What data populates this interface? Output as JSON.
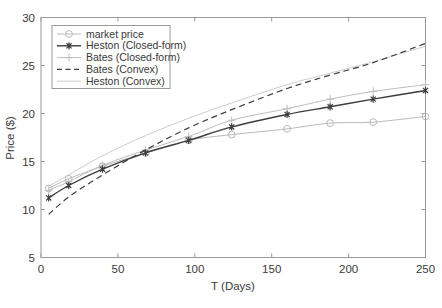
{
  "chart_data": {
    "type": "line",
    "title": "",
    "xlabel": "T (Days)",
    "ylabel": "Price ($)",
    "xlim": [
      0,
      250
    ],
    "ylim": [
      5,
      30
    ],
    "xticks": [
      0,
      50,
      100,
      150,
      200,
      250
    ],
    "yticks": [
      5,
      10,
      15,
      20,
      25,
      30
    ],
    "grid": false,
    "legend_position": "top-left",
    "x": [
      5,
      18,
      40,
      68,
      96,
      124,
      160,
      188,
      216,
      250
    ],
    "series": [
      {
        "name": "market price",
        "marker": "circle",
        "linestyle": "solid",
        "color": "#b9b9b9",
        "values": [
          12.2,
          13.2,
          14.5,
          15.9,
          17.2,
          17.8,
          18.4,
          19.0,
          19.1,
          19.7
        ]
      },
      {
        "name": "Heston (Closed-form)",
        "marker": "asterisk",
        "linestyle": "solid",
        "color": "#3d3d3d",
        "values": [
          11.2,
          12.5,
          14.2,
          15.9,
          17.2,
          18.6,
          19.9,
          20.7,
          21.5,
          22.4
        ]
      },
      {
        "name": "Bates (Closed-form)",
        "marker": "plus",
        "linestyle": "solid",
        "color": "#bdbdbd",
        "values": [
          12.0,
          12.9,
          14.6,
          16.2,
          17.6,
          19.3,
          20.5,
          21.5,
          22.3,
          23.0
        ]
      },
      {
        "name": "Bates (Convex)",
        "marker": "none",
        "linestyle": "dashed",
        "color": "#3d3d3d",
        "values": [
          9.5,
          11.3,
          13.6,
          16.2,
          18.5,
          20.4,
          22.6,
          24.0,
          25.3,
          27.3
        ]
      },
      {
        "name": "Heston (Convex)",
        "marker": "none",
        "linestyle": "solid",
        "color": "#cccccc",
        "values": [
          12.4,
          13.6,
          15.6,
          17.7,
          19.5,
          21.1,
          23.0,
          24.2,
          25.4,
          27.0
        ]
      }
    ]
  },
  "legend": {
    "items": [
      {
        "label": "market price"
      },
      {
        "label": "Heston (Closed-form)"
      },
      {
        "label": "Bates (Closed-form)"
      },
      {
        "label": "Bates (Convex)"
      },
      {
        "label": "Heston (Convex)"
      }
    ]
  },
  "axes": {
    "x_tick_labels": [
      "0",
      "50",
      "100",
      "150",
      "200",
      "250"
    ],
    "y_tick_labels": [
      "5",
      "10",
      "15",
      "20",
      "25",
      "30"
    ],
    "x_title": "T (Days)",
    "y_title": "Price ($)"
  }
}
